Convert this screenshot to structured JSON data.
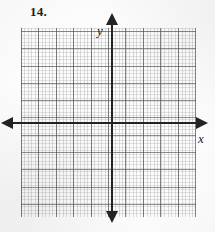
{
  "problem": {
    "number_label": "14."
  },
  "graph": {
    "x_axis_label": "x",
    "y_axis_label": "y",
    "grid_major_spacing_px": 17,
    "grid_minor_spacing_px": 3.5,
    "grid_columns": 11,
    "grid_rows": 11,
    "axis_color": "#232323",
    "grid_major_color": "#888888",
    "grid_minor_color": "#b4b4b4",
    "background_color": "#fcfcfc",
    "arrowheads": [
      "left",
      "right",
      "up",
      "down"
    ],
    "plotted_content": "none"
  },
  "chart_data": {
    "type": "scatter",
    "title": "",
    "xlabel": "x",
    "ylabel": "y",
    "x": [],
    "y": [],
    "series": [],
    "xlim": [
      -5.25,
      5.0
    ],
    "ylim": [
      -5.5,
      5.5
    ],
    "grid": true,
    "legend": false,
    "annotations": [
      "14."
    ],
    "note": "Blank coordinate plane provided for student work; no data plotted."
  }
}
